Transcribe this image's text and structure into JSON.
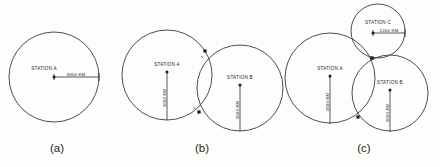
{
  "figure": {
    "background_color": "#fdfdfc",
    "stroke_color": "#3a3a3a",
    "text_color": "#262626"
  },
  "panels": [
    {
      "caption": "(a)",
      "caption_x": 57,
      "caption_y": 152,
      "circles": [
        {
          "name": "station-a-circle",
          "cx": 54,
          "cy": 77,
          "r": 45
        }
      ],
      "stations": [
        {
          "name": "station-a",
          "label": "STATION A",
          "label_x": 44,
          "label_y": 70,
          "label_anchor": "middle",
          "dot_x": 54,
          "dot_y": 77
        }
      ],
      "dimensions": [
        {
          "name": "radius-a",
          "label": "3600 KM",
          "orientation": "horizontal",
          "x1": 54,
          "y1": 77,
          "x2": 99,
          "y2": 77,
          "label_x": 76,
          "label_y": 76
        }
      ],
      "intersections": []
    },
    {
      "caption": "(b)",
      "caption_x": 202,
      "caption_y": 152,
      "circles": [
        {
          "name": "station-a-circle",
          "cx": 167,
          "cy": 75,
          "r": 45
        },
        {
          "name": "station-b-circle",
          "cx": 240,
          "cy": 88,
          "r": 43
        }
      ],
      "stations": [
        {
          "name": "station-a",
          "label": "STATION A",
          "label_x": 167,
          "label_y": 66,
          "label_anchor": "middle",
          "dot_x": 167,
          "dot_y": 72
        },
        {
          "name": "station-b",
          "label": "STATION B",
          "label_x": 240,
          "label_y": 79,
          "label_anchor": "middle",
          "dot_x": 240,
          "dot_y": 85
        }
      ],
      "dimensions": [
        {
          "name": "radius-a",
          "label": "3600 KM",
          "orientation": "vertical",
          "x1": 167,
          "y1": 72,
          "x2": 167,
          "y2": 120,
          "label_x": 166,
          "label_y": 98
        },
        {
          "name": "radius-b",
          "label": "3600 KM",
          "orientation": "vertical",
          "x1": 240,
          "y1": 85,
          "x2": 240,
          "y2": 131,
          "label_x": 239,
          "label_y": 110
        }
      ],
      "intersections": [
        {
          "name": "intersection-upper",
          "x": 205,
          "y": 51,
          "q_x": 202,
          "q_y": 59
        },
        {
          "name": "intersection-lower",
          "x": 199,
          "y": 112,
          "q_x": 194,
          "q_y": 110
        }
      ]
    },
    {
      "caption": "(c)",
      "caption_x": 364,
      "caption_y": 152,
      "circles": [
        {
          "name": "station-a-circle",
          "cx": 330,
          "cy": 78,
          "r": 45
        },
        {
          "name": "station-b-circle",
          "cx": 390,
          "cy": 93,
          "r": 38
        },
        {
          "name": "station-c-circle",
          "cx": 378,
          "cy": 31,
          "r": 27
        }
      ],
      "stations": [
        {
          "name": "station-a",
          "label": "STATION A",
          "label_x": 330,
          "label_y": 70,
          "label_anchor": "middle",
          "dot_x": 330,
          "dot_y": 76
        },
        {
          "name": "station-b",
          "label": "STATION B",
          "label_x": 390,
          "label_y": 84,
          "label_anchor": "middle",
          "dot_x": 390,
          "dot_y": 90
        },
        {
          "name": "station-c",
          "label": "STATION C",
          "label_x": 378,
          "label_y": 24,
          "label_anchor": "middle",
          "dot_x": 373,
          "dot_y": 33
        }
      ],
      "dimensions": [
        {
          "name": "radius-a",
          "label": "3600 KM",
          "orientation": "vertical",
          "x1": 330,
          "y1": 76,
          "x2": 330,
          "y2": 124,
          "label_x": 329,
          "label_y": 102
        },
        {
          "name": "radius-b",
          "label": "3600 KM",
          "orientation": "vertical",
          "x1": 390,
          "y1": 90,
          "x2": 390,
          "y2": 132,
          "label_x": 389,
          "label_y": 113
        },
        {
          "name": "radius-c",
          "label": "1200 KM",
          "orientation": "horizontal",
          "x1": 373,
          "y1": 33,
          "x2": 405,
          "y2": 33,
          "label_x": 389,
          "label_y": 32
        }
      ],
      "intersections": [
        {
          "name": "intersection-abc",
          "x": 372,
          "y": 58,
          "q_x": null,
          "q_y": null
        },
        {
          "name": "intersection-ab-lower",
          "x": 358,
          "y": 117,
          "q_x": null,
          "q_y": null
        }
      ]
    }
  ]
}
